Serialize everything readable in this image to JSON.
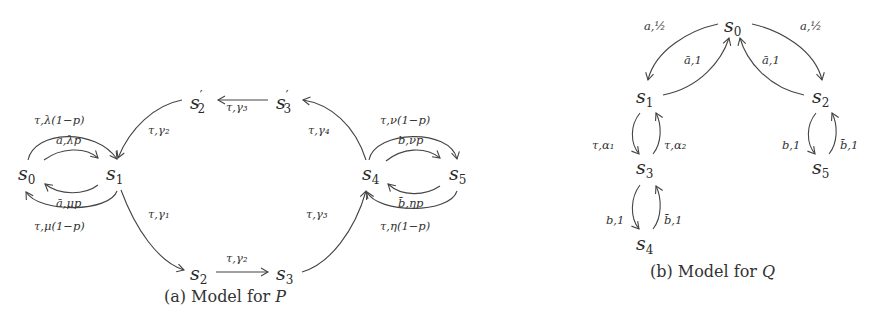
{
  "figure_a": {
    "caption_prefix": "(a) Model for ",
    "caption_var": "P",
    "states": {
      "s0": {
        "base": "s",
        "sub": "0",
        "prime": ""
      },
      "s1": {
        "base": "s",
        "sub": "1",
        "prime": ""
      },
      "s2": {
        "base": "s",
        "sub": "2",
        "prime": ""
      },
      "s3": {
        "base": "s",
        "sub": "3",
        "prime": ""
      },
      "s2p": {
        "base": "s",
        "sub": "2",
        "prime": "′"
      },
      "s3p": {
        "base": "s",
        "sub": "3",
        "prime": "′"
      },
      "s4": {
        "base": "s",
        "sub": "4",
        "prime": ""
      },
      "s5": {
        "base": "s",
        "sub": "5",
        "prime": ""
      }
    },
    "edges": {
      "s0_s1_outer": "τ,λ(1−p)",
      "s0_s1_inner": "a,λp",
      "s1_s0_inner": "ā,μp",
      "s1_s0_outer": "τ,μ(1−p)",
      "s1_s2": "τ,γ₁",
      "s2_s3": "τ,γ₂",
      "s3_s4": "τ,γ₃",
      "s4_s3p": "τ,γ₄",
      "s3p_s2p": "τ,γ₃",
      "s2p_s1": "τ,γ₂",
      "s4_s5_outer": "τ,ν(1−p)",
      "s4_s5_inner": "b,νp",
      "s5_s4_inner": "b̄,ηp",
      "s5_s4_outer": "τ,η(1−p)"
    }
  },
  "figure_b": {
    "caption_prefix": "(b) Model for ",
    "caption_var": "Q",
    "states": {
      "s0": {
        "base": "s",
        "sub": "0"
      },
      "s1": {
        "base": "s",
        "sub": "1"
      },
      "s2": {
        "base": "s",
        "sub": "2"
      },
      "s3": {
        "base": "s",
        "sub": "3"
      },
      "s4": {
        "base": "s",
        "sub": "4"
      },
      "s5": {
        "base": "s",
        "sub": "5"
      }
    },
    "edges": {
      "s0_s1": "a,½",
      "s0_s2": "a,½",
      "s1_s0": "ā,1",
      "s2_s0": "ā,1",
      "s1_s3": "τ,α₁",
      "s3_s1": "τ,α₂",
      "s3_s4": "b,1",
      "s4_s3": "b̄,1",
      "s2_s5": "b,1",
      "s5_s2": "b̄,1"
    }
  }
}
